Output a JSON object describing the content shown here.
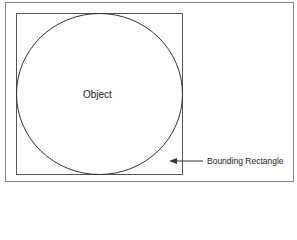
{
  "diagram": {
    "object_label": "Object",
    "bounding_label": "Bounding Rectangle",
    "colors": {
      "outer_frame": "#8a8a8a",
      "inner_rect": "#555555",
      "circle": "#333333",
      "arrow": "#333333"
    }
  }
}
